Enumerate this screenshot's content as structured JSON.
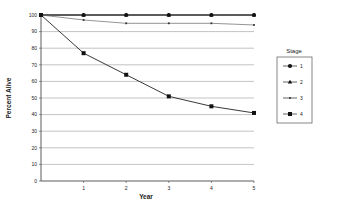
{
  "chart_data": {
    "type": "line",
    "title": "",
    "xlabel": "Year",
    "ylabel": "Percent Alive",
    "x": [
      0,
      1,
      2,
      3,
      4,
      5
    ],
    "x_tick_labels": [
      "1",
      "2",
      "3",
      "4",
      "5"
    ],
    "y_tick_labels": [
      "0",
      "10",
      "20",
      "30",
      "40",
      "50",
      "60",
      "70",
      "80",
      "90",
      "100"
    ],
    "ylim": [
      0,
      100
    ],
    "xlim": [
      0,
      5
    ],
    "grid": "horizontal",
    "legend": {
      "title": "Stage",
      "position": "right"
    },
    "series": [
      {
        "name": "1",
        "marker": "circle",
        "values": [
          100,
          100,
          100,
          100,
          100,
          100
        ]
      },
      {
        "name": "2",
        "marker": "triangle",
        "values": [
          100,
          100,
          100,
          100,
          100,
          100
        ]
      },
      {
        "name": "3",
        "marker": "dash",
        "values": [
          100,
          97,
          95,
          95,
          95,
          94
        ]
      },
      {
        "name": "4",
        "marker": "square",
        "values": [
          100,
          77,
          64,
          51,
          45,
          41
        ]
      }
    ]
  }
}
